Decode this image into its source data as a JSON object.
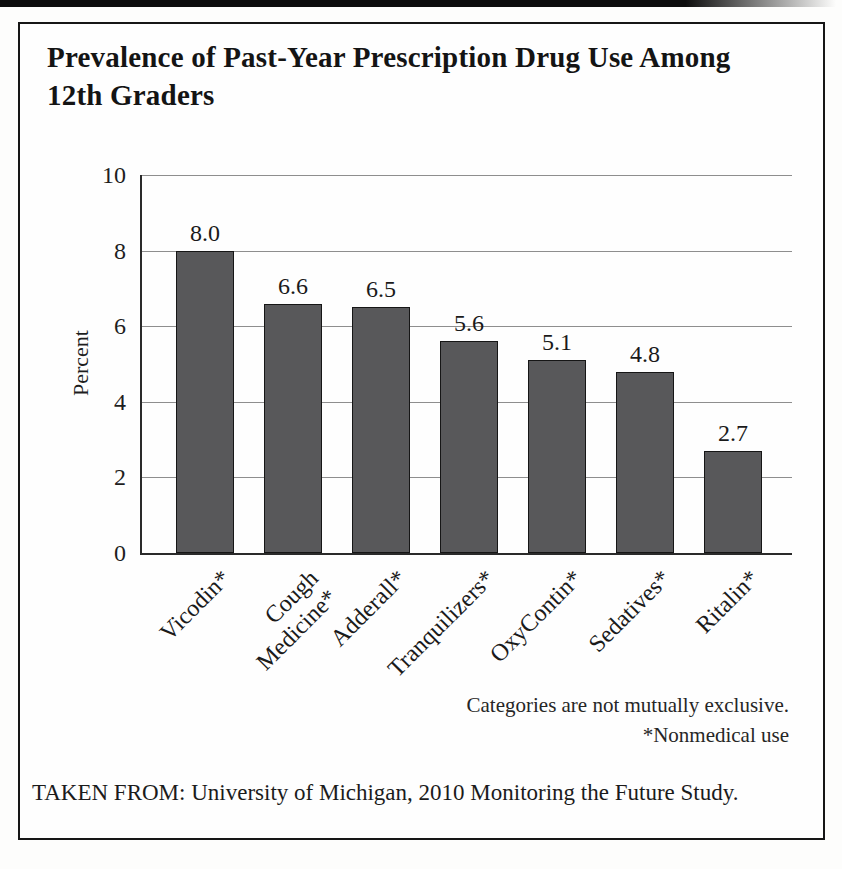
{
  "figure": {
    "title_line1": "Prevalence of Past-Year Prescription Drug Use Among",
    "title_line2": "12th Graders",
    "note_line1": "Categories are not mutually exclusive.",
    "note_line2": "*Nonmedical use",
    "source": "TAKEN FROM: University of Michigan, 2010 Monitoring the Future Study."
  },
  "chart_data": {
    "type": "bar",
    "title": "Prevalence of Past-Year Prescription Drug Use Among 12th Graders",
    "categories": [
      "Vicodin*",
      "Cough Medicine*",
      "Adderall*",
      "Tranquilizers*",
      "OxyContin*",
      "Sedatives*",
      "Ritalin*"
    ],
    "category_display_lines": [
      [
        "Vicodin*"
      ],
      [
        "Cough",
        "Medicine*"
      ],
      [
        "Adderall*"
      ],
      [
        "Tranquilizers*"
      ],
      [
        "OxyContin*"
      ],
      [
        "Sedatives*"
      ],
      [
        "Ritalin*"
      ]
    ],
    "values": [
      8.0,
      6.6,
      6.5,
      5.6,
      5.1,
      4.8,
      2.7
    ],
    "value_labels": [
      "8.0",
      "6.6",
      "6.5",
      "5.6",
      "5.1",
      "4.8",
      "2.7"
    ],
    "xlabel": "",
    "ylabel": "Percent",
    "ylim": [
      0,
      10
    ],
    "yticks": [
      0,
      2,
      4,
      6,
      8,
      10
    ],
    "grid": true,
    "legend": false,
    "bar_color": "#58585a",
    "bar_border_color": "#161616",
    "gridline_color": "#8e8e8e",
    "annotations": [
      "Categories are not mutually exclusive.",
      "*Nonmedical use"
    ],
    "source": "TAKEN FROM: University of Michigan, 2010 Monitoring the Future Study."
  }
}
